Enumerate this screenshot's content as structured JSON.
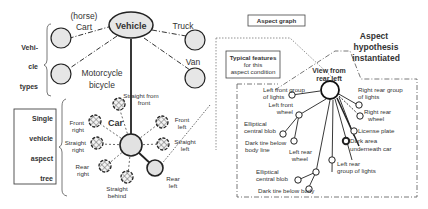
{
  "vehicle_types": {
    "root": "Vehicle",
    "bracket_label": [
      "Vehi-",
      "cle",
      "types"
    ],
    "cart": [
      "(horse)",
      "Cart"
    ],
    "truck": "Truck",
    "motorcycle": [
      "Motorcycle",
      "bicycle"
    ],
    "van": "Van"
  },
  "aspect_tree": {
    "box_label": [
      "Single",
      "vehicle",
      "aspect",
      "tree"
    ],
    "car": "Car",
    "aspects": {
      "straight_front": [
        "Straight from",
        "front"
      ],
      "front_left": [
        "Front",
        "left"
      ],
      "straight_left": [
        "Straight",
        "left"
      ],
      "front_right": [
        "Front",
        "right"
      ],
      "straight_right": [
        "Straight",
        "right"
      ],
      "rear_right": [
        "Rear",
        "right"
      ],
      "straight_behind": [
        "Straight",
        "behind"
      ],
      "rear_left": [
        "Rear",
        "left"
      ]
    }
  },
  "aspect_graph": {
    "title": "Aspect graph",
    "hypothesis": [
      "Aspect",
      "hypothesis",
      "instantiated"
    ],
    "typical_features": [
      "Typical features",
      "for this",
      "aspect condition"
    ],
    "view": [
      "View from",
      "rear left"
    ],
    "features": {
      "left_front_lights": [
        "Left front group",
        "of lights"
      ],
      "right_rear_lights": [
        "Right rear group",
        "of lights"
      ],
      "left_front_wheel": [
        "Left front",
        "wheel"
      ],
      "right_rear_wheel": [
        "Right rear",
        "wheel"
      ],
      "elliptical_blob_1": [
        "Elliptical",
        "central blob"
      ],
      "license_plate": "License plate",
      "dark_tire_1": [
        "Dark tire below",
        "body line"
      ],
      "dark_area": [
        "Dark area",
        "underneath car"
      ],
      "left_rear_wheel": [
        "Left rear",
        "wheel"
      ],
      "left_rear_lights": [
        "Left rear",
        "group of lights"
      ],
      "elliptical_blob_2": [
        "Elliptical",
        "central blob"
      ],
      "dark_tire_2": "Dark tire below body"
    }
  },
  "colors": {
    "node_fill": "#e6e6e6",
    "stroke": "#222222",
    "text": "#333333"
  }
}
